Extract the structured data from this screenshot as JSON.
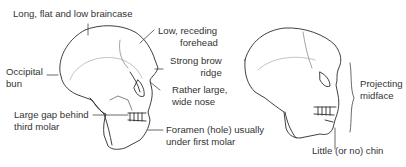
{
  "labels": {
    "braincase": "Long, flat and low braincase",
    "forehead_1": "Low, receding",
    "forehead_2": "forehead",
    "occipital_1": "Occipital",
    "occipital_2": "bun",
    "brow_1": "Strong brow",
    "brow_2": "ridge",
    "nose_1": "Rather large,",
    "nose_2": "wide nose",
    "gap_1": "Large gap behind",
    "gap_2": "third molar",
    "foramen_1": "Foramen (hole) usually",
    "foramen_2": "under first molar",
    "midface_1": "Projecting",
    "midface_2": "midface",
    "chin": "Little (or no) chin"
  },
  "colors": {
    "line": "#2a2a2a",
    "text": "#333333",
    "background": "#ffffff"
  }
}
